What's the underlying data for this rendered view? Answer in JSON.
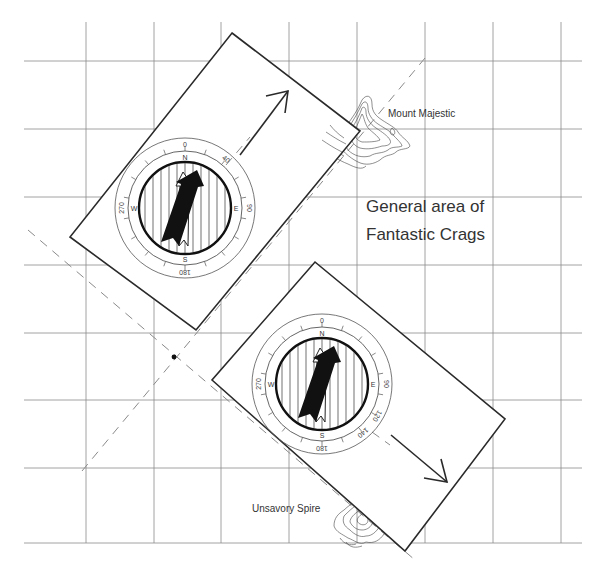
{
  "figure": {
    "labels": {
      "mount": "Mount Majestic",
      "spire": "Unsavory Spire",
      "area_line1": "General area of",
      "area_line2": "Fantastic Crags"
    },
    "compasses": [
      {
        "id": "compass-1",
        "target": "Mount Majestic",
        "bearing_deg": 40,
        "dial_numbers": [
          "0",
          "40",
          "90",
          "180",
          "270"
        ],
        "cardinals": [
          "N",
          "E",
          "S",
          "W"
        ]
      },
      {
        "id": "compass-2",
        "target": "Unsavory Spire",
        "bearing_deg": 140,
        "dial_numbers": [
          "0",
          "90",
          "120",
          "140",
          "180",
          "270"
        ],
        "cardinals": [
          "N",
          "E",
          "S",
          "W"
        ]
      }
    ],
    "colors": {
      "ink": "#2a2a2a",
      "grid": "#8a8a8a",
      "background": "#ffffff",
      "needle": "#111111"
    }
  }
}
